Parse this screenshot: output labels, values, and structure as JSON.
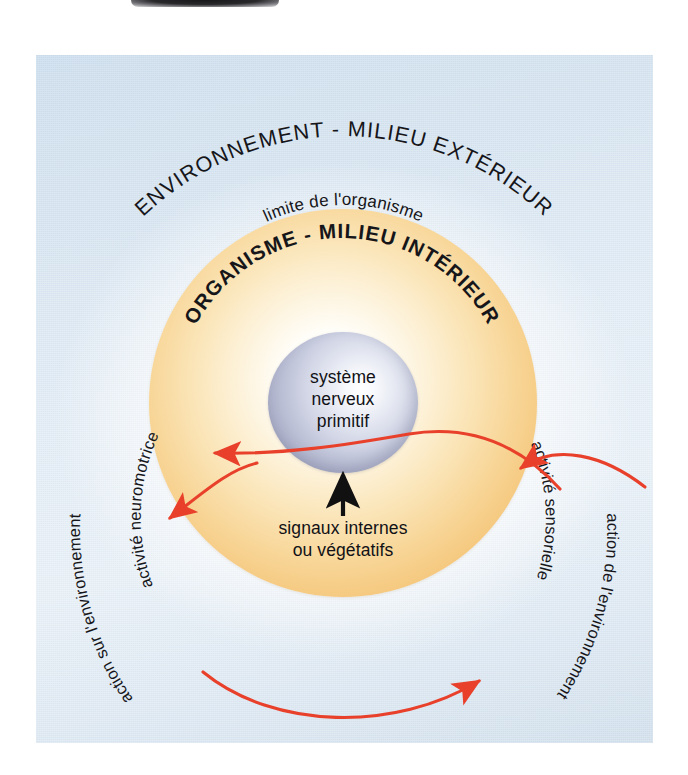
{
  "figure": {
    "name": "organisme-environnement-diagram",
    "language": "fr"
  },
  "colors": {
    "panel_background_light": "#e4eef7",
    "panel_background_blue": "#cfe0ef",
    "organism_fill_outer": "#eeb75f",
    "organism_fill_inner": "#fffdf7",
    "nerve_sphere_outer": "#9497b3",
    "nerve_sphere_highlight": "#ffffff",
    "arrow_red": "#e8402a",
    "arrow_black": "#111111",
    "text_dark": "#16161a"
  },
  "labels": {
    "environment_outer": "ENVIRONNEMENT - MILIEU EXTÉRIEUR",
    "organism_limit": "limite de l'organisme",
    "organism_inner": "ORGANISME - MILIEU INTÉRIEUR",
    "nerve_sphere_line1": "système",
    "nerve_sphere_line2": "nerveux",
    "nerve_sphere_line3": "primitif",
    "internal_signals_line1": "signaux internes",
    "internal_signals_line2": "ou végétatifs",
    "neuromotor_activity": "activité neuromotrice",
    "sensory_activity": "activité sensorielle",
    "action_on_environment": "action sur l'environnement",
    "action_of_environment": "action de l'environnement"
  },
  "arrows": [
    {
      "name": "sensory-inflow-arrow",
      "label": "activité sensorielle",
      "color": "#e8402a",
      "direction": "environment-to-nervous-system",
      "head": "up-left-into-organism"
    },
    {
      "name": "neuromotor-outflow-arrow",
      "label": "activité neuromotrice",
      "color": "#e8402a",
      "direction": "nervous-system-to-organism-edge",
      "head": "left"
    },
    {
      "name": "action-on-environment-arrow",
      "label": "action sur l'environnement",
      "color": "#e8402a",
      "direction": "organism-to-environment",
      "head": "down-left"
    },
    {
      "name": "action-of-environment-arrow",
      "label": "action de l'environnement",
      "color": "#e8402a",
      "direction": "environment-to-organism",
      "head": "right"
    },
    {
      "name": "internal-signals-arrow",
      "label": "signaux internes ou végétatifs",
      "color": "#111111",
      "direction": "body-to-nervous-system",
      "head": "up"
    }
  ]
}
